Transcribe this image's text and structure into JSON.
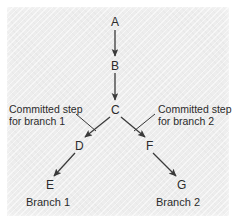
{
  "figure": {
    "kind": "branching-pathway-diagram",
    "background_color": "#ededed",
    "border_color": "#ffffff",
    "stroke_color": "#3a3a3a",
    "text_color": "#2b2b2b"
  },
  "nodes": [
    {
      "id": "A",
      "label": "A",
      "x": 115,
      "y": 22
    },
    {
      "id": "B",
      "label": "B",
      "x": 115,
      "y": 66
    },
    {
      "id": "C",
      "label": "C",
      "x": 115,
      "y": 110
    },
    {
      "id": "D",
      "label": "D",
      "x": 79,
      "y": 146
    },
    {
      "id": "F",
      "label": "F",
      "x": 149,
      "y": 146
    },
    {
      "id": "E",
      "label": "E",
      "x": 50,
      "y": 185
    },
    {
      "id": "G",
      "label": "G",
      "x": 180,
      "y": 185
    }
  ],
  "edges": [
    {
      "from": "A",
      "to": "B",
      "direction": "down"
    },
    {
      "from": "B",
      "to": "C",
      "direction": "down"
    },
    {
      "from": "C",
      "to": "D",
      "direction": "down-left"
    },
    {
      "from": "C",
      "to": "F",
      "direction": "down-right"
    },
    {
      "from": "D",
      "to": "E",
      "direction": "down-left"
    },
    {
      "from": "F",
      "to": "G",
      "direction": "down-right"
    }
  ],
  "annotations": {
    "left": {
      "line1": "Committed step",
      "line2": "for branch 1",
      "points_to_edge": "C-D"
    },
    "right": {
      "line1": "Committed step",
      "line2": "for branch 2",
      "points_to_edge": "C-F"
    }
  },
  "branch_labels": {
    "left": "Branch 1",
    "right": "Branch 2"
  }
}
